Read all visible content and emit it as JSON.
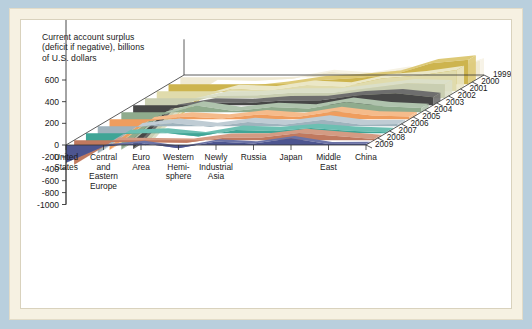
{
  "figure": {
    "title": "Current account surplus\n(deficit if negative), billions\nof U.S. dollars",
    "background_color": "#b9cfdd",
    "mat_color": "#f6f1e2",
    "card_color": "#ffffff"
  },
  "chart_data": {
    "type": "area",
    "projection": "3d-ribbon",
    "title": "Current account surplus (deficit if negative), billions of U.S. dollars",
    "xlabel": "",
    "ylabel": "Current account surplus (deficit if negative), billions of U.S. dollars",
    "zlabel": "",
    "ylim": [
      -1000,
      600
    ],
    "yticks": [
      600,
      400,
      200,
      0,
      -200,
      -400,
      -600,
      -800,
      -1000
    ],
    "ytick_labels": [
      "600",
      "400",
      "200",
      "0",
      "-200",
      "-400",
      "-600",
      "-800",
      "-1000"
    ],
    "grid": false,
    "legend": "none",
    "categories": [
      "United\nStates",
      "Central\nand\nEastern\nEurope",
      "Euro\nArea",
      "Western\nHemi-\nsphere",
      "Newly\nIndustrial\nAsia",
      "Russia",
      "Japan",
      "Middle\nEast",
      "China"
    ],
    "categories_plain": [
      "United States",
      "Central and Eastern Europe",
      "Euro Area",
      "Western Hemisphere",
      "Newly Industrial Asia",
      "Russia",
      "Japan",
      "Middle East",
      "China"
    ],
    "depth_labels": [
      "1999",
      "2000",
      "2001",
      "2002",
      "2003",
      "2004",
      "2005",
      "2006",
      "2007",
      "2008",
      "2009"
    ],
    "series": [
      {
        "name": "1999",
        "color": "#4d5590",
        "side_color": "#6c73a6",
        "values": [
          -300,
          -25,
          35,
          -55,
          60,
          25,
          115,
          15,
          20
        ]
      },
      {
        "name": "2000",
        "color": "#c0795f",
        "side_color": "#d49b83",
        "values": [
          -415,
          -30,
          -35,
          -45,
          40,
          45,
          120,
          70,
          20
        ]
      },
      {
        "name": "2001",
        "color": "#3fa596",
        "side_color": "#6cbfb2",
        "values": [
          -390,
          -15,
          10,
          -55,
          55,
          35,
          85,
          40,
          17
        ]
      },
      {
        "name": "2002",
        "color": "#9fb3bd",
        "side_color": "#bfccd4",
        "values": [
          -460,
          -20,
          55,
          -15,
          70,
          30,
          110,
          30,
          35
        ]
      },
      {
        "name": "2003",
        "color": "#ef9d5e",
        "side_color": "#f5bb8b",
        "values": [
          -520,
          -35,
          45,
          10,
          80,
          35,
          135,
          60,
          46
        ]
      },
      {
        "name": "2004",
        "color": "#8fab8d",
        "side_color": "#afc3ad",
        "values": [
          -630,
          -60,
          110,
          20,
          85,
          60,
          172,
          100,
          69
        ]
      },
      {
        "name": "2005",
        "color": "#474747",
        "side_color": "#6e6e6e",
        "values": [
          -740,
          -60,
          45,
          35,
          80,
          84,
          166,
          200,
          134
        ]
      },
      {
        "name": "2006",
        "color": "#c9ceb1",
        "side_color": "#dbdfc8",
        "values": [
          -800,
          -90,
          45,
          50,
          95,
          92,
          171,
          250,
          232
        ]
      },
      {
        "name": "2007",
        "color": "#e0dbac",
        "side_color": "#ebe7c6",
        "values": [
          -710,
          -135,
          35,
          15,
          105,
          77,
          211,
          265,
          354
        ]
      },
      {
        "name": "2008",
        "color": "#cdb44e",
        "side_color": "#ddc976",
        "values": [
          -670,
          -155,
          -95,
          -30,
          65,
          104,
          157,
          350,
          412
        ]
      },
      {
        "name": "2009",
        "color": "#efe9d2",
        "side_color": "#f6f2e4",
        "values": [
          -420,
          -45,
          -60,
          -25,
          90,
          41,
          142,
          70,
          284
        ]
      }
    ]
  }
}
